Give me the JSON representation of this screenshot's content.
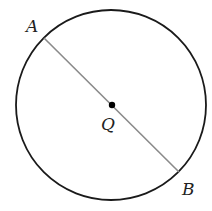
{
  "diagram": {
    "type": "circle-with-diameter",
    "circle": {
      "cx": 111,
      "cy": 105,
      "r": 95,
      "stroke": "#1a1a1a"
    },
    "diameter": {
      "from": "A",
      "to": "B",
      "stroke": "#8a8a8a"
    },
    "points": [
      {
        "id": "A",
        "label": "A",
        "x": 44,
        "y": 38,
        "label_x": 26,
        "label_y": 32
      },
      {
        "id": "Q",
        "label": "Q",
        "x": 112,
        "y": 105,
        "label_x": 101,
        "label_y": 130
      },
      {
        "id": "B",
        "label": "B",
        "x": 179,
        "y": 172,
        "label_x": 182,
        "label_y": 195
      }
    ],
    "center_dot_color": "#000000"
  }
}
